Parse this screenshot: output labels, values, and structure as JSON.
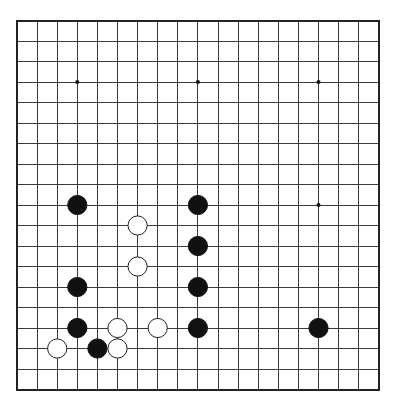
{
  "board": {
    "size": 19,
    "origin_x": 17,
    "origin_y": 20.5,
    "spacing_x": 20.1,
    "spacing_y": 20.5,
    "stone_radius": 9.6,
    "colors": {
      "background": "#ffffff",
      "line": "#3a3a3a",
      "black_stone": "#111111",
      "white_stone": "#ffffff"
    },
    "star_points": [
      [
        3,
        3
      ],
      [
        9,
        3
      ],
      [
        15,
        3
      ],
      [
        3,
        9
      ],
      [
        9,
        9
      ],
      [
        15,
        9
      ],
      [
        3,
        15
      ],
      [
        9,
        15
      ],
      [
        15,
        15
      ]
    ],
    "stones": [
      {
        "color": "black",
        "col": 3,
        "row": 9
      },
      {
        "color": "black",
        "col": 9,
        "row": 9
      },
      {
        "color": "white",
        "col": 6,
        "row": 10
      },
      {
        "color": "black",
        "col": 9,
        "row": 11
      },
      {
        "color": "white",
        "col": 6,
        "row": 12
      },
      {
        "color": "black",
        "col": 3,
        "row": 13
      },
      {
        "color": "black",
        "col": 9,
        "row": 13
      },
      {
        "color": "black",
        "col": 3,
        "row": 15
      },
      {
        "color": "white",
        "col": 5,
        "row": 15
      },
      {
        "color": "white",
        "col": 7,
        "row": 15
      },
      {
        "color": "black",
        "col": 9,
        "row": 15
      },
      {
        "color": "black",
        "col": 15,
        "row": 15
      },
      {
        "color": "white",
        "col": 2,
        "row": 16
      },
      {
        "color": "black",
        "col": 4,
        "row": 16
      },
      {
        "color": "white",
        "col": 5,
        "row": 16
      }
    ]
  }
}
